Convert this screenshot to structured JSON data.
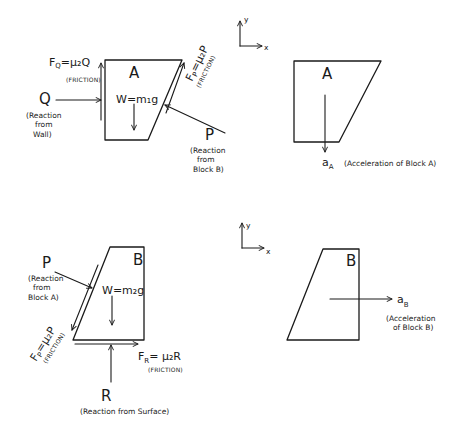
{
  "diagram": {
    "panels": {
      "fbd_a": {
        "block_label": "A",
        "weight": "W=m₁g",
        "forces": {
          "fq": {
            "label": "F",
            "sub": "Q",
            "eq": "=μ₂Q",
            "note": "(FRICTION)"
          },
          "q": {
            "label": "Q",
            "note_lines": [
              "(Reaction",
              "from",
              "Wall)"
            ]
          },
          "fp": {
            "label": "F",
            "sub": "P",
            "eq": "=μ₂P",
            "note": "(FRICTION)"
          },
          "p": {
            "label": "P",
            "note_lines": [
              "(Reaction",
              "from",
              "Block B)"
            ]
          }
        }
      },
      "axes_a": {
        "x": "x",
        "y": "y"
      },
      "kin_a": {
        "block_label": "A",
        "accel_label": "a",
        "accel_sub": "A",
        "accel_note": "(Acceleration of Block A)"
      },
      "fbd_b": {
        "block_label": "B",
        "weight": "W=m₂g",
        "forces": {
          "p": {
            "label": "P",
            "note_lines": [
              "(Reaction",
              "from",
              "Block A)"
            ]
          },
          "fp": {
            "label": "F",
            "sub": "P",
            "eq": "=μ₂P",
            "note": "(FRICTION)"
          },
          "fr": {
            "label": "F",
            "sub": "R",
            "eq": "= μ₂R",
            "note": "(FRICTION)"
          },
          "r": {
            "label": "R",
            "note": "(Reaction from Surface)"
          }
        }
      },
      "axes_b": {
        "x": "x",
        "y": "y"
      },
      "kin_b": {
        "block_label": "B",
        "accel_label": "a",
        "accel_sub": "B",
        "accel_note_lines": [
          "(Acceleration",
          "of Block B)"
        ]
      }
    },
    "colors": {
      "ink": "#1a1a1a",
      "paper": "#ffffff"
    }
  }
}
